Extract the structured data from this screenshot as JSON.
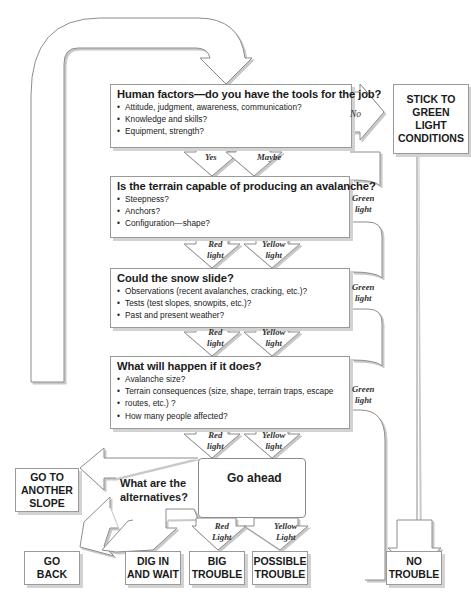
{
  "diagram": {
    "type": "avalanche-decision-flowchart",
    "questions": [
      {
        "title": "Human factors—do you have the tools for the job?",
        "bullets": [
          "Attitude, judgment, awareness, communication?",
          "Knowledge and skills?",
          "Equipment, strength?"
        ],
        "exits": {
          "left": "Yes",
          "right": "Maybe",
          "side": "No"
        }
      },
      {
        "title": "Is the terrain capable of producing an avalanche?",
        "bullets": [
          "Steepness?",
          "Anchors?",
          "Configuration—shape?"
        ],
        "exits": {
          "left": "Red light",
          "right": "Yellow light",
          "side": "Green light"
        }
      },
      {
        "title": "Could the snow slide?",
        "bullets": [
          "Observations (recent avalanches, cracking, etc.)?",
          "Tests (test slopes, snowpits, etc.)?",
          "Past and present weather?"
        ],
        "exits": {
          "left": "Red light",
          "right": "Yellow light",
          "side": "Green light"
        }
      },
      {
        "title": "What will happen if it does?",
        "bullets": [
          "Avalanche size?",
          "Terrain consequences (size, shape, terrain traps, escape",
          "routes, etc.) ?",
          "How many people affected?"
        ],
        "exits": {
          "left": "Red light",
          "right": "Yellow light",
          "side": "Green light"
        }
      }
    ],
    "alternatives_label": "What are the alternatives?",
    "alternatives_line1": "What are the",
    "alternatives_line2": "alternatives?",
    "go_ahead_label": "Go ahead",
    "go_ahead_exits": {
      "left_1": "Red",
      "left_2": "Light",
      "right_1": "Yellow",
      "right_2": "Light"
    },
    "labels": {
      "yes": "Yes",
      "maybe": "Maybe",
      "no": "No",
      "red": "Red",
      "yellow": "Yellow",
      "green": "Green",
      "light": "light"
    },
    "outcomes": {
      "stick": [
        "STICK TO",
        "GREEN",
        "LIGHT",
        "CONDITIONS"
      ],
      "another_slope": [
        "GO TO",
        "ANOTHER",
        "SLOPE"
      ],
      "go_back": [
        "GO",
        "BACK"
      ],
      "dig_in": [
        "DIG IN",
        "AND WAIT"
      ],
      "big_trouble": [
        "BIG",
        "TROUBLE"
      ],
      "possible_trouble": [
        "POSSIBLE",
        "TROUBLE"
      ],
      "no_trouble": [
        "NO",
        "TROUBLE"
      ]
    }
  }
}
